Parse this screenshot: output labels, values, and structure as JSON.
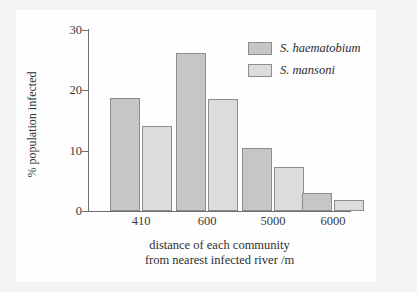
{
  "chart_data": {
    "type": "bar",
    "title": "",
    "xlabel": "distance of each community from nearest infected river /m",
    "xlabel_line1": "distance of each community",
    "xlabel_line2": "from nearest infected river /m",
    "ylabel": "% population infected",
    "categories": [
      "410",
      "600",
      "5000",
      "6000"
    ],
    "ylim": [
      0,
      30
    ],
    "yticks": [
      0,
      10,
      20,
      30
    ],
    "ytick_labels": [
      "0",
      "10",
      "20",
      "30"
    ],
    "grid": false,
    "legend_position": "top-right",
    "series": [
      {
        "name": "S. haematobium",
        "color": "#c6c6c6",
        "values": [
          18.8,
          26.2,
          10.4,
          3.0
        ]
      },
      {
        "name": "S. mansoni",
        "color": "#dcdcdc",
        "values": [
          14.1,
          18.5,
          7.3,
          1.9
        ]
      }
    ]
  },
  "legend": {
    "items": [
      {
        "label": "S. haematobium",
        "swatch": "legend-swatch-haematobium"
      },
      {
        "label": "S. mansoni",
        "swatch": "legend-swatch-mansoni"
      }
    ]
  },
  "axes": {
    "y_title": "% population infected",
    "x_title_line1": "distance of each community",
    "x_title_line2": "from nearest infected river /m",
    "y_ticks": [
      "30",
      "20",
      "10",
      "0"
    ],
    "x_ticks": [
      "410",
      "600",
      "5000",
      "6000"
    ]
  },
  "colors": {
    "series_a": "#c6c6c6",
    "series_b": "#dcdcdc",
    "bar_outline": "#8d8d8d",
    "axis": "#6e6e6e",
    "canvas": "#fefefe",
    "page_background": "#f4f4f4",
    "text": "#2b2b2b"
  }
}
